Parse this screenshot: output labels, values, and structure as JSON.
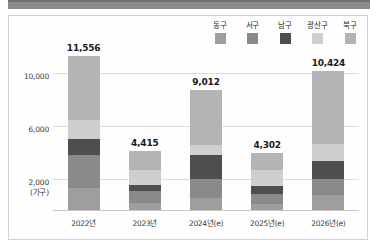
{
  "top_strip": {
    "color": "#8c8c8c"
  },
  "chart_data": {
    "type": "bar",
    "subtype": "stacked-column",
    "title": "",
    "xlabel": "",
    "ylabel": "(가구)",
    "unit_label": "(가구)",
    "categories": [
      "2022년",
      "2023년",
      "2024년(e)",
      "2025년(e)",
      "2026년(e)"
    ],
    "yticks": [
      "2,000",
      "6,000",
      "10,000"
    ],
    "ytick_values": [
      2000,
      6000,
      10000
    ],
    "ylim": [
      0,
      12400
    ],
    "grid": true,
    "legend_position": "top-right",
    "totals": [
      11556,
      4415,
      9012,
      4302,
      10424
    ],
    "total_labels": [
      "11,556",
      "4,415",
      "9,012",
      "4,302",
      "10,424"
    ],
    "series": [
      {
        "name": "동구",
        "color": "#9e9e9e",
        "values": [
          1650,
          520,
          900,
          430,
          1100
        ]
      },
      {
        "name": "서구",
        "color": "#8a8a8a",
        "values": [
          2450,
          900,
          1450,
          780,
          1250
        ]
      },
      {
        "name": "남구",
        "color": "#4e4e4e",
        "values": [
          1250,
          430,
          1750,
          560,
          1350
        ]
      },
      {
        "name": "광산구",
        "color": "#cfcfcf",
        "values": [
          1450,
          1180,
          780,
          1230,
          1300
        ]
      },
      {
        "name": "북구",
        "color": "#b4b4b4",
        "values": [
          4756,
          1385,
          4132,
          1302,
          5424
        ]
      }
    ]
  },
  "legend": {
    "items": [
      {
        "label": "동구",
        "color": "#9e9e9e",
        "swatch_name": "legend-swatch-donggu"
      },
      {
        "label": "서구",
        "color": "#8a8a8a",
        "swatch_name": "legend-swatch-seogu"
      },
      {
        "label": "남구",
        "color": "#4e4e4e",
        "swatch_name": "legend-swatch-namgu"
      },
      {
        "label": "광산구",
        "color": "#cfcfcf",
        "swatch_name": "legend-swatch-gwangsangu"
      },
      {
        "label": "북구",
        "color": "#b4b4b4",
        "swatch_name": "legend-swatch-bukgu"
      }
    ]
  }
}
